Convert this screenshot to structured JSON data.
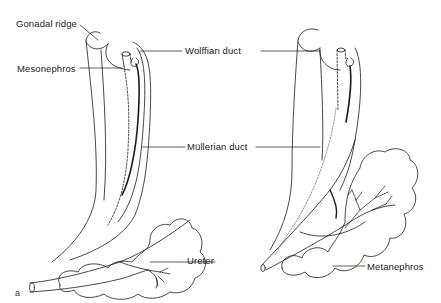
{
  "figure": {
    "panel_label": "a",
    "left_drawing": {
      "labels": {
        "gonadal_ridge": "Gonadal ridge",
        "mesonephros": "Mesonephros",
        "ureter": "Ureter"
      }
    },
    "shared_labels": {
      "wolffian_duct": "Wolffian duct",
      "mullerian_duct": "Müllerian duct"
    },
    "right_drawing": {
      "labels": {
        "metanephros": "Metanephros"
      }
    },
    "colors": {
      "line": "#1a1a1a",
      "background": "#ffffff"
    }
  }
}
